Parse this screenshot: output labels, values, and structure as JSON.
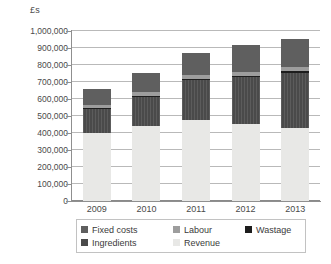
{
  "chart_data": {
    "type": "bar",
    "title": "",
    "subtitle": "",
    "xlabel": "",
    "ylabel": "£s",
    "stacked": true,
    "orientation": "vertical",
    "grid": true,
    "legend_position": "bottom",
    "categories": [
      "2009",
      "2010",
      "2011",
      "2012",
      "2013"
    ],
    "ylim": [
      0,
      1000000
    ],
    "ytick_step": 100000,
    "ytick_labels": [
      "0",
      "100,000",
      "200,000",
      "300,000",
      "400,000",
      "500,000",
      "600,000",
      "700,000",
      "800,000",
      "900,000",
      "1,000,000"
    ],
    "ytick_values": [
      0,
      100000,
      200000,
      300000,
      400000,
      500000,
      600000,
      700000,
      800000,
      900000,
      1000000
    ],
    "series": [
      {
        "name": "Revenue",
        "color": "#e8e8e6",
        "values": [
          400000,
          440000,
          478000,
          455000,
          430000
        ]
      },
      {
        "name": "Ingredients",
        "color": "#4a4a4a",
        "values": [
          145000,
          175000,
          232000,
          272000,
          325000
        ]
      },
      {
        "name": "Wastage",
        "color": "#1d1d1d",
        "values": [
          5000,
          5000,
          8000,
          8000,
          8000
        ]
      },
      {
        "name": "Labour",
        "color": "#9d9d9d",
        "values": [
          15000,
          20000,
          22000,
          25000,
          25000
        ]
      },
      {
        "name": "Fixed costs",
        "color": "#5f5f5f",
        "values": [
          95000,
          115000,
          130000,
          155000,
          165000
        ]
      }
    ],
    "totals": [
      660000,
      755000,
      870000,
      915000,
      953000
    ]
  },
  "legend": {
    "rows": [
      [
        {
          "label": "Fixed costs",
          "swatch": "#5f5f5f"
        },
        {
          "label": "Labour",
          "swatch": "#9d9d9d"
        },
        {
          "label": "Wastage",
          "swatch": "#1d1d1d"
        }
      ],
      [
        {
          "label": "Ingredients",
          "swatch": "#4a4a4a"
        },
        {
          "label": "Revenue",
          "swatch": "#e8e8e6"
        }
      ]
    ]
  }
}
